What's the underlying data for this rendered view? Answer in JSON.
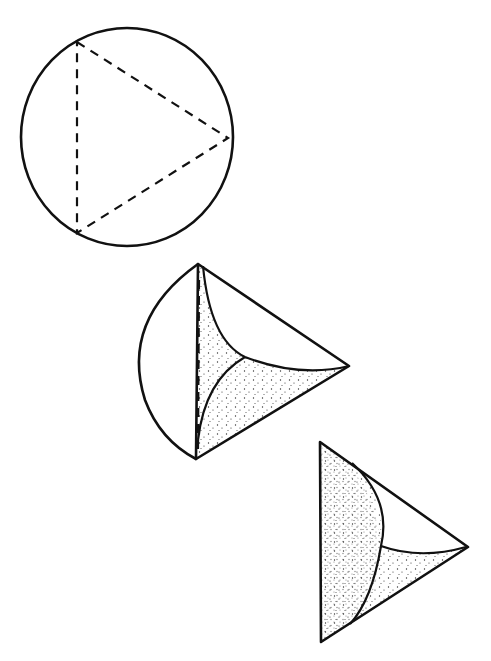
{
  "figure": {
    "colors": {
      "ink": "#111111",
      "background": "#ffffff",
      "stipple": "#333333"
    },
    "shapes": [
      {
        "name": "sphere-with-inscribed-triangle",
        "stage": 1
      },
      {
        "name": "partially-folded-shape",
        "stage": 2
      },
      {
        "name": "tetrahedral-shape",
        "stage": 3
      }
    ]
  }
}
